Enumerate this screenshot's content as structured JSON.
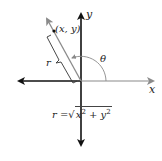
{
  "diagram": {
    "axes": {
      "x_label": "x",
      "y_label": "y"
    },
    "point": {
      "label": "(x, y)"
    },
    "radius_label": "r",
    "angle_label": "θ",
    "formula": {
      "lhs": "r",
      "equals": "=",
      "radical": "√",
      "term1_base": "x",
      "term1_exp": "2",
      "plus": "+",
      "term2_base": "y",
      "term2_exp": "2"
    },
    "colors": {
      "axis_dark": "#111111",
      "axis_gray": "#8a8a8a",
      "ray": "#8a8a8a",
      "text": "#222222"
    }
  }
}
